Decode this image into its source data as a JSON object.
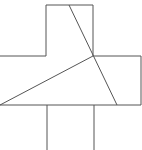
{
  "diagram": {
    "stroke_color": "#555555",
    "background": "#ffffff",
    "outline_points": [
      [
        0,
        56
      ],
      [
        46,
        56
      ],
      [
        46,
        5
      ],
      [
        93,
        5
      ],
      [
        93,
        56
      ],
      [
        141,
        56
      ],
      [
        141,
        105
      ],
      [
        0,
        105
      ]
    ],
    "stem": {
      "left_x": 47,
      "right_x": 94,
      "top_y": 105,
      "bottom_y": 150
    },
    "diagonals": [
      {
        "x1": 69,
        "y1": 5,
        "x2": 117,
        "y2": 105
      },
      {
        "x1": 0,
        "y1": 105,
        "x2": 93,
        "y2": 56
      }
    ],
    "labels": []
  }
}
